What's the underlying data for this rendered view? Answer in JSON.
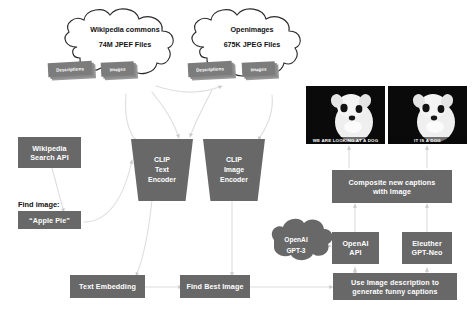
{
  "diagram": {
    "colors": {
      "node_fill": "#686868",
      "chip_fill": "#7c7c7c",
      "connector": "#d9d9d9",
      "text_on_node": "#ffffff",
      "text_on_canvas": "#111111",
      "background": "#ffffff",
      "photo_background": "#0b0b0b"
    }
  },
  "clouds": [
    {
      "id": "wikipedia-commons",
      "title": "Wikipedia commons",
      "subtitle": "74M JPEF Files",
      "chips": [
        {
          "label": "Descriptions"
        },
        {
          "label": "Images"
        }
      ]
    },
    {
      "id": "openimages",
      "title": "Openimages",
      "subtitle": "675K JPEG Files",
      "chips": [
        {
          "label": "Descriptions"
        },
        {
          "label": "Images"
        }
      ]
    },
    {
      "id": "openai-gpt3",
      "title": "OpenAI",
      "subtitle": "GPT-3",
      "chips": []
    }
  ],
  "encoders": [
    {
      "id": "clip-text-encoder",
      "lines": [
        "CLIP",
        "Text",
        "Encoder"
      ]
    },
    {
      "id": "clip-image-encoder",
      "lines": [
        "CLIP",
        "Image",
        "Encoder"
      ]
    }
  ],
  "nodes": {
    "wikipedia_search_api": {
      "lines": [
        "Wikipedia",
        "Search API"
      ]
    },
    "apple_pie": {
      "lines": [
        "“Apple Pie”"
      ]
    },
    "text_embedding": {
      "lines": [
        "Text Embedding"
      ]
    },
    "find_best_image": {
      "lines": [
        "Find Best Image"
      ]
    },
    "composite_captions": {
      "lines": [
        "Composite new captions",
        "with Image"
      ]
    },
    "openai_api": {
      "lines": [
        "OpenAI",
        "API"
      ]
    },
    "eleuther_gpt_neo": {
      "lines": [
        "Eleuther",
        "GPT-Neo"
      ]
    },
    "use_image_description": {
      "lines": [
        "Use Image description to",
        "generate funny captions"
      ]
    }
  },
  "labels": {
    "find_image": "Find image:"
  },
  "photos": [
    {
      "id": "dog-photo-original",
      "alt": "white dog on black background",
      "caption": "WE ARE LOOKING AT A DOG"
    },
    {
      "id": "dog-photo-captioned",
      "alt": "white dog on black background",
      "caption": "IT IS A DOG"
    }
  ]
}
